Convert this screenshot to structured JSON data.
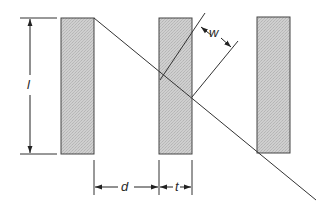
{
  "figure": {
    "colors": {
      "slat_fill": "#c8c8c8",
      "slat_stroke": "#333333",
      "line": "#333333",
      "background": "#ffffff"
    },
    "labels": {
      "length": "l",
      "width": "w",
      "spacing": "d",
      "thickness": "t"
    },
    "slats": [
      {
        "name": "slat-1",
        "x": 61,
        "y": 18,
        "w": 33,
        "h": 136
      },
      {
        "name": "slat-2",
        "x": 159,
        "y": 18,
        "w": 33,
        "h": 136
      },
      {
        "name": "slat-3",
        "x": 257,
        "y": 17,
        "w": 33,
        "h": 136
      }
    ]
  }
}
